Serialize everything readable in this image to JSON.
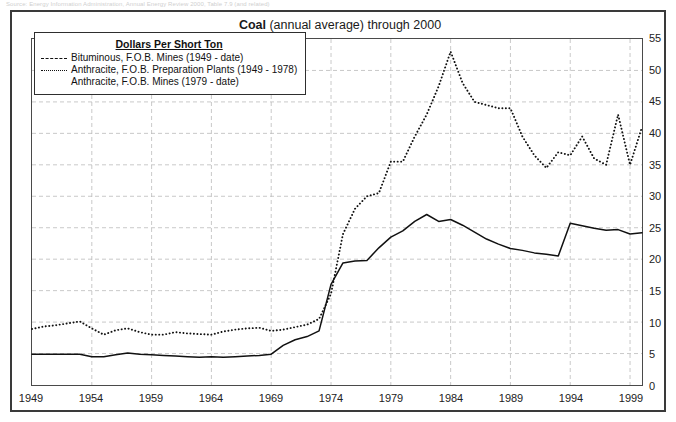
{
  "source_note": "Source: Energy Information Administration, Annual Energy Review 2000, Table 7.9 (and related)",
  "figure": {
    "title_strong": "Coal",
    "title_rest": " (annual average) through 2000"
  },
  "legend": {
    "title": "Dollars Per Short Ton",
    "entries": [
      {
        "label": "Bituminous, F.O.B. Mines (1949 - date)",
        "style": "dashed",
        "icon": "dashed-line-icon"
      },
      {
        "label": "Anthracite, F.O.B. Preparation Plants (1949 - 1978)",
        "style": "dotted",
        "icon": "dotted-line-icon"
      },
      {
        "label": "Anthracite, F.O.B. Mines (1979 - date)",
        "style": "none",
        "icon": "no-line-icon"
      }
    ]
  },
  "chart_data": {
    "type": "line",
    "title": "Coal (annual average) through 2000",
    "xlabel": "",
    "ylabel": "",
    "xlim": [
      1949,
      2000
    ],
    "ylim": [
      0,
      55
    ],
    "ytick_step": 5,
    "xtick_step": 5,
    "grid": true,
    "grid_style": "dashed",
    "y_axis_position": "right",
    "legend_position": "upper-left-inside",
    "ytick_labels": [
      "0",
      "5",
      "10",
      "15",
      "20",
      "25",
      "30",
      "35",
      "40",
      "45",
      "50",
      "55"
    ],
    "xtick_labels": [
      "1949",
      "1954",
      "1959",
      "1964",
      "1969",
      "1974",
      "1979",
      "1984",
      "1989",
      "1994",
      "1999"
    ],
    "x": [
      1949,
      1950,
      1951,
      1952,
      1953,
      1954,
      1955,
      1956,
      1957,
      1958,
      1959,
      1960,
      1961,
      1962,
      1963,
      1964,
      1965,
      1966,
      1967,
      1968,
      1969,
      1970,
      1971,
      1972,
      1973,
      1974,
      1975,
      1976,
      1977,
      1978,
      1979,
      1980,
      1981,
      1982,
      1983,
      1984,
      1985,
      1986,
      1987,
      1988,
      1989,
      1990,
      1991,
      1992,
      1993,
      1994,
      1995,
      1996,
      1997,
      1998,
      1999,
      2000
    ],
    "series": [
      {
        "name": "Bituminous, F.O.B. Mines (1949 - date)",
        "style": "solid",
        "color": "#111111",
        "values": [
          4.9,
          4.9,
          4.9,
          4.9,
          4.9,
          4.5,
          4.5,
          4.8,
          5.1,
          4.9,
          4.8,
          4.7,
          4.6,
          4.5,
          4.4,
          4.5,
          4.4,
          4.5,
          4.6,
          4.7,
          4.9,
          6.3,
          7.2,
          7.7,
          8.6,
          16.0,
          19.4,
          19.7,
          19.8,
          21.8,
          23.5,
          24.5,
          26.0,
          27.1,
          26.0,
          26.3,
          25.4,
          24.3,
          23.2,
          22.4,
          21.7,
          21.4,
          21.0,
          20.8,
          20.5,
          25.7,
          25.3,
          24.9,
          24.6,
          24.7,
          24.0,
          24.2
        ]
      },
      {
        "name": "Anthracite, F.O.B. Preparation Plants (1949 - 1978) / F.O.B. Mines (1979 - date)",
        "style": "dotted",
        "color": "#111111",
        "values": [
          8.9,
          9.3,
          9.5,
          9.8,
          10.1,
          9.0,
          8.0,
          8.7,
          9.0,
          8.4,
          8.0,
          8.0,
          8.4,
          8.2,
          8.1,
          8.0,
          8.5,
          8.8,
          9.0,
          9.1,
          8.6,
          8.8,
          9.2,
          9.6,
          10.5,
          14.5,
          24.0,
          28.0,
          30.0,
          30.5,
          35.5,
          35.5,
          39.5,
          43.0,
          47.5,
          53.0,
          48.0,
          45.0,
          44.5,
          44.0,
          44.0,
          39.5,
          36.5,
          34.5,
          37.0,
          36.5,
          39.5,
          36.0,
          35.0,
          43.0,
          35.0,
          41.0
        ]
      }
    ]
  }
}
